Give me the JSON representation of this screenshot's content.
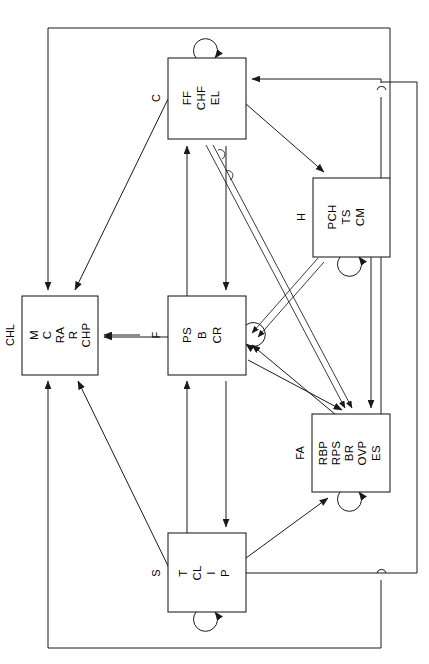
{
  "diagram": {
    "type": "block-diagram",
    "orientation": "text-rotated-90",
    "stroke_color": "#1a1a1a",
    "background_color": "#ffffff",
    "nodes": [
      {
        "id": "C",
        "tag": "C",
        "labels": [
          "FF",
          "CHF",
          "EL"
        ],
        "x": 168,
        "y": 58,
        "w": 78,
        "h": 81,
        "self_loop": "top"
      },
      {
        "id": "H",
        "tag": "H",
        "labels": [
          "PCH",
          "TS",
          "CM"
        ],
        "x": 313,
        "y": 178,
        "w": 77,
        "h": 79,
        "self_loop": "bottom"
      },
      {
        "id": "CHL",
        "tag": "CHL",
        "labels": [
          "M",
          "C",
          "RA",
          "R",
          "CHP"
        ],
        "x": 22,
        "y": 296,
        "w": 76,
        "h": 79,
        "self_loop": "none"
      },
      {
        "id": "F",
        "tag": "F",
        "labels": [
          "PS",
          "B",
          "CR"
        ],
        "x": 168,
        "y": 296,
        "w": 78,
        "h": 79,
        "self_loop": "right"
      },
      {
        "id": "FA",
        "tag": "FA",
        "labels": [
          "RBP",
          "RPS",
          "BR",
          "OVP",
          "ES"
        ],
        "x": 312,
        "y": 414,
        "w": 78,
        "h": 78,
        "self_loop": "bottom"
      },
      {
        "id": "S",
        "tag": "S",
        "labels": [
          "T",
          "CL",
          "I",
          "P"
        ],
        "x": 168,
        "y": 533,
        "w": 78,
        "h": 79,
        "self_loop": "bottom"
      }
    ],
    "edges": [
      {
        "from": "C",
        "to": "C",
        "kind": "self-loop"
      },
      {
        "from": "H",
        "to": "H",
        "kind": "self-loop"
      },
      {
        "from": "F",
        "to": "F",
        "kind": "self-loop"
      },
      {
        "from": "FA",
        "to": "FA",
        "kind": "self-loop"
      },
      {
        "from": "S",
        "to": "S",
        "kind": "self-loop"
      },
      {
        "from": "C",
        "to": "CHL",
        "kind": "diagonal"
      },
      {
        "from": "C",
        "to": "H",
        "kind": "diagonal"
      },
      {
        "from": "C",
        "to": "FA",
        "kind": "double-line"
      },
      {
        "from": "FA",
        "to": "C",
        "kind": "double-line"
      },
      {
        "from": "F",
        "to": "C",
        "kind": "vertical"
      },
      {
        "from": "C",
        "to": "F",
        "kind": "vertical"
      },
      {
        "from": "F",
        "to": "CHL",
        "kind": "horizontal"
      },
      {
        "from": "F",
        "to": "FA",
        "kind": "diagonal"
      },
      {
        "from": "FA",
        "to": "F",
        "kind": "diagonal"
      },
      {
        "from": "H",
        "to": "F",
        "kind": "double-line"
      },
      {
        "from": "S",
        "to": "CHL",
        "kind": "diagonal"
      },
      {
        "from": "S",
        "to": "F",
        "kind": "vertical"
      },
      {
        "from": "F",
        "to": "S",
        "kind": "vertical"
      },
      {
        "from": "S",
        "to": "FA",
        "kind": "diagonal"
      },
      {
        "from": "H",
        "to": "CHL",
        "kind": "outer-loop-left"
      },
      {
        "from": "FA",
        "to": "CHL",
        "kind": "outer-loop-bottom"
      },
      {
        "from": "FA",
        "to": "C",
        "kind": "outer-loop-right"
      },
      {
        "from": "S",
        "to": "C",
        "kind": "outer-loop-far-right"
      },
      {
        "from": "H",
        "to": "CHL",
        "kind": "side-input"
      }
    ],
    "wire_hops": [
      {
        "x": 381,
        "y": 90
      },
      {
        "x": 382,
        "y": 574
      }
    ]
  }
}
